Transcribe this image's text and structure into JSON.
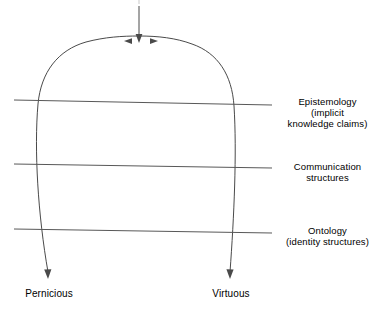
{
  "diagram": {
    "line_color": "#555555",
    "curve_color": "#4a4a4a",
    "text_color": "#000000",
    "background": "#ffffff",
    "apex": {
      "inflow_arrow": "downward-input-arrow",
      "branch_left_arrow": "leftward-branch-arrowhead",
      "branch_right_arrow": "rightward-branch-arrowhead"
    },
    "layers": [
      {
        "id": "epistemology",
        "line_name": "epistemology-divider-line",
        "label": "Epistemology\n(implicit\nknowledge claims)"
      },
      {
        "id": "communication",
        "line_name": "communication-divider-line",
        "label": "Communication\nstructures"
      },
      {
        "id": "ontology",
        "line_name": "ontology-divider-line",
        "label": "Ontology\n(identity structures)"
      }
    ],
    "outcomes": [
      {
        "id": "pernicious",
        "label": "Pernicious",
        "arrow_name": "pernicious-outcome-arrow"
      },
      {
        "id": "virtuous",
        "label": "Virtuous",
        "arrow_name": "virtuous-outcome-arrow"
      }
    ]
  }
}
